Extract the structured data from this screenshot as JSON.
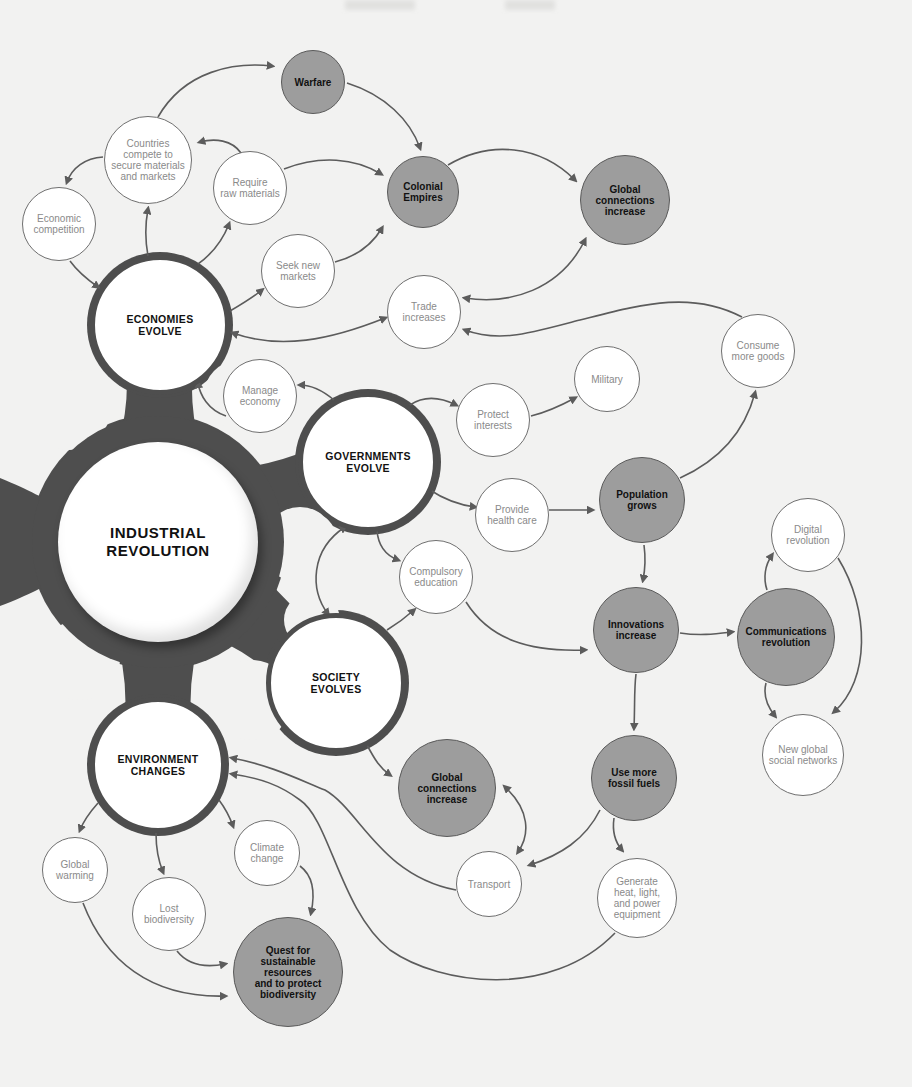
{
  "diagram": {
    "title": "INDUSTRIAL\nREVOLUTION",
    "colors": {
      "background": "#f2f2f1",
      "hub": "#4e4e4e",
      "shaded_node": "#9d9d9d",
      "arrow": "#5c5c5c",
      "minor_text": "#8a8a8a"
    },
    "center": {
      "id": "industrial-revolution",
      "label": "INDUSTRIAL\nREVOLUTION",
      "x": 158,
      "y": 542,
      "r": 100
    },
    "major_nodes": [
      {
        "id": "economies-evolve",
        "label": "ECONOMIES\nEVOLVE",
        "x": 160,
        "y": 325,
        "r": 70
      },
      {
        "id": "governments-evolve",
        "label": "GOVERNMENTS\nEVOLVE",
        "x": 368,
        "y": 462,
        "r": 70
      },
      {
        "id": "society-evolves",
        "label": "SOCIETY\nEVOLVES",
        "x": 336,
        "y": 683,
        "r": 70
      },
      {
        "id": "environment-changes",
        "label": "ENVIRONMENT\nCHANGES",
        "x": 158,
        "y": 765,
        "r": 68
      }
    ],
    "shaded_nodes": [
      {
        "id": "warfare",
        "label": "Warfare",
        "x": 313,
        "y": 82,
        "r": 32
      },
      {
        "id": "colonial-empires",
        "label": "Colonial\nEmpires",
        "x": 423,
        "y": 192,
        "r": 36
      },
      {
        "id": "global-connections-top",
        "label": "Global\nconnections\nincrease",
        "x": 625,
        "y": 200,
        "r": 45
      },
      {
        "id": "population-grows",
        "label": "Population\ngrows",
        "x": 642,
        "y": 500,
        "r": 43
      },
      {
        "id": "innovations-increase",
        "label": "Innovations\nincrease",
        "x": 636,
        "y": 630,
        "r": 43
      },
      {
        "id": "communications-revolution",
        "label": "Communications\nrevolution",
        "x": 786,
        "y": 637,
        "r": 49
      },
      {
        "id": "global-connections-bottom",
        "label": "Global\nconnections\nincrease",
        "x": 447,
        "y": 788,
        "r": 49
      },
      {
        "id": "use-more-fossil-fuels",
        "label": "Use more\nfossil fuels",
        "x": 634,
        "y": 778,
        "r": 43
      },
      {
        "id": "quest-sustainable",
        "label": "Quest for\nsustainable\nresources\nand to protect\nbiodiversity",
        "x": 288,
        "y": 972,
        "r": 55
      }
    ],
    "minor_nodes": [
      {
        "id": "countries-compete",
        "label": "Countries\ncompete to\nsecure materials\nand markets",
        "x": 148,
        "y": 160,
        "r": 44
      },
      {
        "id": "economic-competition",
        "label": "Economic\ncompetition",
        "x": 59,
        "y": 224,
        "r": 37
      },
      {
        "id": "require-raw-materials",
        "label": "Require\nraw materials",
        "x": 250,
        "y": 188,
        "r": 37
      },
      {
        "id": "seek-new-markets",
        "label": "Seek new\nmarkets",
        "x": 298,
        "y": 271,
        "r": 37
      },
      {
        "id": "trade-increases",
        "label": "Trade\nincreases",
        "x": 424,
        "y": 312,
        "r": 37
      },
      {
        "id": "consume-more-goods",
        "label": "Consume\nmore goods",
        "x": 758,
        "y": 351,
        "r": 37
      },
      {
        "id": "military",
        "label": "Military",
        "x": 607,
        "y": 379,
        "r": 33
      },
      {
        "id": "manage-economy",
        "label": "Manage\neconomy",
        "x": 260,
        "y": 396,
        "r": 37
      },
      {
        "id": "protect-interests",
        "label": "Protect\ninterests",
        "x": 493,
        "y": 420,
        "r": 37
      },
      {
        "id": "provide-health-care",
        "label": "Provide\nhealth care",
        "x": 512,
        "y": 515,
        "r": 37
      },
      {
        "id": "compulsory-education",
        "label": "Compulsory\neducation",
        "x": 436,
        "y": 577,
        "r": 37
      },
      {
        "id": "digital-revolution",
        "label": "Digital\nrevolution",
        "x": 808,
        "y": 535,
        "r": 37
      },
      {
        "id": "new-global-social-networks",
        "label": "New global\nsocial networks",
        "x": 803,
        "y": 755,
        "r": 41
      },
      {
        "id": "global-warming",
        "label": "Global\nwarming",
        "x": 75,
        "y": 870,
        "r": 33
      },
      {
        "id": "lost-biodiversity",
        "label": "Lost\nbiodiversity",
        "x": 169,
        "y": 914,
        "r": 37
      },
      {
        "id": "climate-change",
        "label": "Climate\nchange",
        "x": 267,
        "y": 853,
        "r": 33
      },
      {
        "id": "transport",
        "label": "Transport",
        "x": 489,
        "y": 884,
        "r": 33
      },
      {
        "id": "generate-heat-light",
        "label": "Generate\nheat, light,\nand power\nequipment",
        "x": 637,
        "y": 898,
        "r": 40
      }
    ],
    "edges": [
      {
        "from": "countries-compete",
        "to": "warfare",
        "d": "M158,117 C185,70 235,62 272,66",
        "ends": "end"
      },
      {
        "from": "warfare",
        "to": "colonial-empires",
        "d": "M347,83 C385,95 410,120 420,148",
        "ends": "end"
      },
      {
        "from": "countries-compete",
        "to": "economic-competition",
        "d": "M103,157 C85,158 72,168 67,182",
        "ends": "end"
      },
      {
        "from": "require-raw-materials",
        "to": "countries-compete",
        "d": "M241,153 C232,140 215,138 200,142",
        "ends": "end"
      },
      {
        "from": "require-raw-materials",
        "to": "colonial-empires",
        "d": "M284,169 C320,155 355,158 381,174",
        "ends": "end"
      },
      {
        "from": "seek-new-markets",
        "to": "colonial-empires",
        "d": "M335,262 C358,256 372,245 382,228",
        "ends": "end"
      },
      {
        "from": "colonial-empires",
        "to": "global-connections-top",
        "d": "M448,165 C490,140 540,145 575,180",
        "ends": "end"
      },
      {
        "from": "global-connections-top",
        "to": "trade-increases",
        "d": "M585,240 C560,290 510,305 465,298",
        "ends": "both"
      },
      {
        "from": "consume-more-goods",
        "to": "trade-increases",
        "d": "M742,317 C690,290 640,305 580,320 C530,333 500,343 465,330",
        "ends": "end"
      },
      {
        "from": "economic-competition",
        "to": "economies-evolve",
        "d": "M70,261 C78,272 88,280 98,287",
        "ends": "end"
      },
      {
        "from": "economies-evolve",
        "to": "countries-compete",
        "d": "M148,256 C145,240 145,225 148,209",
        "ends": "end"
      },
      {
        "from": "economies-evolve",
        "to": "require-raw-materials",
        "d": "M198,264 C212,254 222,242 229,224",
        "ends": "end"
      },
      {
        "from": "economies-evolve",
        "to": "seek-new-markets",
        "d": "M230,311 C242,304 252,298 262,290",
        "ends": "end"
      },
      {
        "from": "economies-evolve",
        "to": "trade-increases",
        "d": "M233,333 C280,350 330,340 385,318",
        "ends": "both"
      },
      {
        "from": "governments-evolve",
        "to": "manage-economy",
        "d": "M334,400 C322,390 312,385 300,385",
        "ends": "end"
      },
      {
        "from": "manage-economy",
        "to": "economies-evolve",
        "d": "M226,416 C208,410 200,395 198,383",
        "ends": "end"
      },
      {
        "from": "governments-evolve",
        "to": "protect-interests",
        "d": "M410,405 C425,395 440,397 456,405",
        "ends": "end"
      },
      {
        "from": "protect-interests",
        "to": "military",
        "d": "M531,416 C548,412 562,405 575,398",
        "ends": "end"
      },
      {
        "from": "governments-evolve",
        "to": "provide-health-care",
        "d": "M430,490 C445,500 460,505 475,507",
        "ends": "end"
      },
      {
        "from": "provide-health-care",
        "to": "population-grows",
        "d": "M549,510 L592,510",
        "ends": "end"
      },
      {
        "from": "population-grows",
        "to": "consume-more-goods",
        "d": "M680,478 C720,460 745,430 755,393",
        "ends": "end"
      },
      {
        "from": "population-grows",
        "to": "innovations-increase",
        "d": "M644,545 C646,560 645,570 643,580",
        "ends": "end"
      },
      {
        "from": "innovations-increase",
        "to": "communications-revolution",
        "d": "M680,633 C700,636 715,634 732,632",
        "ends": "end"
      },
      {
        "from": "communications-revolution",
        "to": "digital-revolution",
        "d": "M767,590 C763,578 765,565 772,555",
        "ends": "end"
      },
      {
        "from": "digital-revolution",
        "to": "new-global-social-networks",
        "d": "M838,558 C870,610 870,680 834,712",
        "ends": "end"
      },
      {
        "from": "communications-revolution",
        "to": "new-global-social-networks",
        "d": "M766,683 C763,695 766,705 775,716",
        "ends": "end"
      },
      {
        "from": "governments-evolve",
        "to": "compulsory-education",
        "d": "M377,530 C378,545 385,555 398,560",
        "ends": "end"
      },
      {
        "from": "governments-evolve",
        "to": "society-evolves",
        "d": "M345,527 C310,550 310,590 328,614",
        "ends": "both"
      },
      {
        "from": "society-evolves",
        "to": "compulsory-education",
        "d": "M387,630 C397,624 405,618 414,610",
        "ends": "end"
      },
      {
        "from": "compulsory-education",
        "to": "innovations-increase",
        "d": "M466,602 C490,640 530,652 585,650",
        "ends": "end"
      },
      {
        "from": "innovations-increase",
        "to": "use-more-fossil-fuels",
        "d": "M636,674 C634,690 635,705 634,728",
        "ends": "end"
      },
      {
        "from": "society-evolves",
        "to": "global-connections-bottom",
        "d": "M367,745 C375,760 380,768 390,775",
        "ends": "end"
      },
      {
        "from": "global-connections-bottom",
        "to": "transport",
        "d": "M505,787 C530,810 530,835 518,852",
        "ends": "both"
      },
      {
        "from": "use-more-fossil-fuels",
        "to": "transport",
        "d": "M600,810 C585,840 560,855 530,865",
        "ends": "end"
      },
      {
        "from": "use-more-fossil-fuels",
        "to": "generate-heat-light",
        "d": "M614,818 C612,832 615,842 622,850",
        "ends": "end"
      },
      {
        "from": "transport",
        "to": "environment-changes",
        "d": "M456,890 C380,875 360,810 325,790 C300,780 270,765 232,758",
        "ends": "end"
      },
      {
        "from": "generate-heat-light",
        "to": "environment-changes",
        "d": "M615,933 C550,1000 440,985 390,950 C340,910 330,820 300,800 C280,785 260,778 232,774",
        "ends": "end"
      },
      {
        "from": "environment-changes",
        "to": "global-warming",
        "d": "M98,803 C90,812 84,820 80,830",
        "ends": "end"
      },
      {
        "from": "environment-changes",
        "to": "lost-biodiversity",
        "d": "M156,833 C156,848 158,860 163,872",
        "ends": "end"
      },
      {
        "from": "environment-changes",
        "to": "climate-change",
        "d": "M219,800 C225,808 229,815 233,826",
        "ends": "end"
      },
      {
        "from": "climate-change",
        "to": "quest-sustainable",
        "d": "M300,866 C312,875 316,890 311,913",
        "ends": "end"
      },
      {
        "from": "lost-biodiversity",
        "to": "quest-sustainable",
        "d": "M177,951 C188,965 205,968 225,964",
        "ends": "end"
      },
      {
        "from": "global-warming",
        "to": "quest-sustainable",
        "d": "M83,903 C105,960 150,998 225,996",
        "ends": "end"
      }
    ]
  }
}
